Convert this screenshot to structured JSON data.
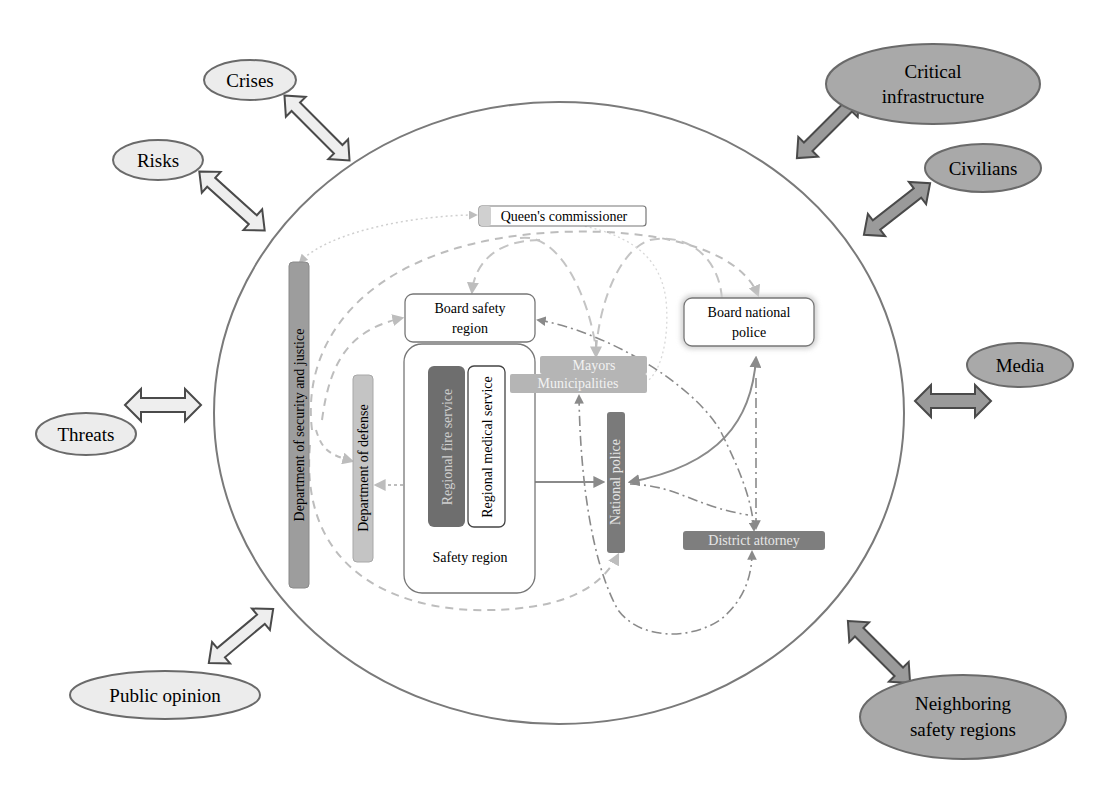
{
  "diagram": {
    "type": "stakeholder-network",
    "colors": {
      "outer_circle": "#777777",
      "light_ellipse_fill": "#ececec",
      "dark_ellipse_fill": "#a9a9a9",
      "ellipse_stroke": "#6a6a6a",
      "light_arrow_fill": "#eeeeee",
      "dark_arrow_fill": "#9a9a9a",
      "arrow_stroke": "#4a4a4a",
      "dept_security_fill": "#9d9d9d",
      "dept_defense_fill": "#c4c4c4",
      "fire_service_fill": "#6e6e6e",
      "mayors_fill": "#b5b5b5",
      "national_police_fill": "#7a7a7a",
      "district_attorney_fill": "#7e7e7e",
      "queens_fill": "#d0d0d0",
      "connector_light": "#bdbdbd",
      "connector_dark": "#8a8a8a"
    },
    "external_factors": {
      "light": [
        {
          "id": "crises",
          "label": "Crises"
        },
        {
          "id": "risks",
          "label": "Risks"
        },
        {
          "id": "threats",
          "label": "Threats"
        },
        {
          "id": "public-opinion",
          "label": "Public opinion"
        }
      ],
      "dark": [
        {
          "id": "critical-infrastructure",
          "label_line1": "Critical",
          "label_line2": "infrastructure"
        },
        {
          "id": "civilians",
          "label": "Civilians"
        },
        {
          "id": "media",
          "label": "Media"
        },
        {
          "id": "neighboring-safety-regions",
          "label_line1": "Neighboring",
          "label_line2": "safety regions"
        }
      ]
    },
    "inner_nodes": {
      "queens_commissioner": "Queen's commissioner",
      "dept_security_justice": "Department of security and justice",
      "dept_defense": "Department of defense",
      "board_safety_region_line1": "Board safety",
      "board_safety_region_line2": "region",
      "board_national_police_line1": "Board national",
      "board_national_police_line2": "police",
      "regional_fire_service": "Regional fire service",
      "regional_medical_service": "Regional medical service",
      "safety_region": "Safety region",
      "mayors": "Mayors",
      "municipalities": "Municipalities",
      "national_police": "National police",
      "district_attorney": "District attorney"
    }
  }
}
